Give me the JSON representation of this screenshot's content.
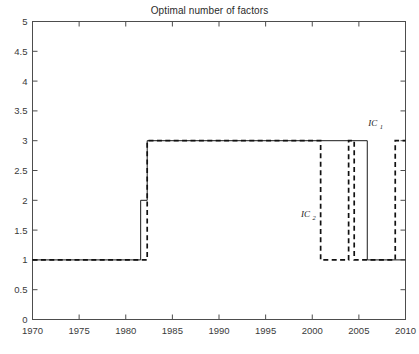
{
  "chart_data": {
    "type": "line",
    "title": "Optimal number of factors",
    "xlabel": "",
    "ylabel": "",
    "xlim": [
      1970,
      2010
    ],
    "ylim": [
      0,
      5
    ],
    "grid": false,
    "legend_position": "inline-annotation",
    "x_ticks": [
      "1970",
      "1975",
      "1980",
      "1985",
      "1990",
      "1995",
      "2000",
      "2005",
      "2010"
    ],
    "x_tick_values": [
      1970,
      1975,
      1980,
      1985,
      1990,
      1995,
      2000,
      2005,
      2010
    ],
    "y_ticks": [
      "0",
      "0.5",
      "1",
      "1.5",
      "2",
      "2.5",
      "3",
      "3.5",
      "4",
      "4.5",
      "5"
    ],
    "y_tick_values": [
      0,
      0.5,
      1,
      1.5,
      2,
      2.5,
      3,
      3.5,
      4,
      4.5,
      5
    ],
    "series": [
      {
        "name": "IC_1",
        "label": "IC",
        "label_sub": "1",
        "style": "solid",
        "color": "#1a1a1a",
        "label_x": 2006.0,
        "label_y": 3.25,
        "steps": [
          {
            "x": 1970.0,
            "y": 1
          },
          {
            "x": 1981.6,
            "y": 1
          },
          {
            "x": 1981.6,
            "y": 2
          },
          {
            "x": 1982.3,
            "y": 2
          },
          {
            "x": 1982.3,
            "y": 3
          },
          {
            "x": 2005.9,
            "y": 3
          },
          {
            "x": 2005.9,
            "y": 1
          },
          {
            "x": 2010.0,
            "y": 1
          }
        ]
      },
      {
        "name": "IC_2",
        "label": "IC",
        "label_sub": "2",
        "style": "dashed",
        "color": "#111111",
        "label_x": 1998.8,
        "label_y": 1.72,
        "steps": [
          {
            "x": 1970.0,
            "y": 1
          },
          {
            "x": 1982.3,
            "y": 1
          },
          {
            "x": 1982.3,
            "y": 3
          },
          {
            "x": 2000.9,
            "y": 3
          },
          {
            "x": 2000.9,
            "y": 1
          },
          {
            "x": 2003.9,
            "y": 1
          },
          {
            "x": 2003.9,
            "y": 3
          },
          {
            "x": 2004.5,
            "y": 3
          },
          {
            "x": 2004.5,
            "y": 1
          },
          {
            "x": 2008.9,
            "y": 1
          },
          {
            "x": 2008.9,
            "y": 3
          },
          {
            "x": 2010.0,
            "y": 3
          }
        ]
      }
    ],
    "colors": {
      "axis": "#4d4d4d",
      "background": "#ffffff",
      "ic1": "#1a1a1a",
      "ic2": "#111111"
    }
  }
}
